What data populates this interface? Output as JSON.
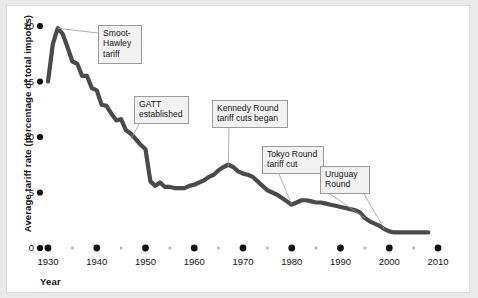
{
  "figure": {
    "background_color": "#e9e9e9",
    "plate_color": "#ffffff",
    "line_color": "#4a4a4a",
    "tick_color": "#111111",
    "minor_tick_color": "#b8b8b8",
    "callout_bg": "#f2f2f2",
    "callout_border": "#9b9b9b",
    "leader_color": "#9b9b9b",
    "source_note": "·· ··"
  },
  "chart_data": {
    "type": "line",
    "title": "",
    "xlabel": "Year",
    "ylabel": "Average tariff rate (percentage of total imports)",
    "xlim": [
      1930,
      2010
    ],
    "ylim": [
      0,
      20
    ],
    "grid": false,
    "legend": "none",
    "y_ticks": [
      {
        "value": 0,
        "label": "0"
      },
      {
        "value": 5,
        "label": "5"
      },
      {
        "value": 10,
        "label": "10"
      },
      {
        "value": 15,
        "label": "15"
      },
      {
        "value": 20,
        "label": "20"
      }
    ],
    "x_ticks": [
      {
        "value": 1930,
        "label": "1930",
        "major": true
      },
      {
        "value": 1935,
        "label": "",
        "major": false
      },
      {
        "value": 1940,
        "label": "1940",
        "major": true
      },
      {
        "value": 1945,
        "label": "",
        "major": false
      },
      {
        "value": 1950,
        "label": "1950",
        "major": true
      },
      {
        "value": 1955,
        "label": "",
        "major": false
      },
      {
        "value": 1960,
        "label": "1960",
        "major": true
      },
      {
        "value": 1965,
        "label": "",
        "major": false
      },
      {
        "value": 1970,
        "label": "1970",
        "major": true
      },
      {
        "value": 1975,
        "label": "",
        "major": false
      },
      {
        "value": 1980,
        "label": "1980",
        "major": true
      },
      {
        "value": 1985,
        "label": "",
        "major": false
      },
      {
        "value": 1990,
        "label": "1990",
        "major": true
      },
      {
        "value": 1995,
        "label": "",
        "major": false
      },
      {
        "value": 2000,
        "label": "2000",
        "major": true
      },
      {
        "value": 2005,
        "label": "",
        "major": false
      },
      {
        "value": 2010,
        "label": "2010",
        "major": true
      }
    ],
    "series": [
      {
        "name": "Average tariff rate",
        "x": [
          1930,
          1931,
          1932,
          1933,
          1934,
          1935,
          1936,
          1937,
          1938,
          1939,
          1940,
          1941,
          1942,
          1943,
          1944,
          1945,
          1946,
          1947,
          1948,
          1949,
          1950,
          1951,
          1952,
          1953,
          1954,
          1955,
          1956,
          1957,
          1958,
          1959,
          1960,
          1961,
          1962,
          1963,
          1964,
          1965,
          1966,
          1967,
          1968,
          1969,
          1970,
          1971,
          1972,
          1973,
          1974,
          1975,
          1976,
          1977,
          1978,
          1979,
          1980,
          1981,
          1982,
          1983,
          1984,
          1985,
          1986,
          1987,
          1988,
          1989,
          1990,
          1991,
          1992,
          1993,
          1994,
          1995,
          1996,
          1997,
          1998,
          1999,
          2000,
          2001,
          2002,
          2003,
          2004,
          2005,
          2006,
          2007,
          2008
        ],
        "values": [
          15.0,
          18.4,
          19.8,
          19.3,
          18.1,
          16.8,
          16.6,
          15.5,
          15.5,
          14.4,
          14.2,
          12.9,
          12.8,
          12.1,
          11.5,
          11.6,
          10.6,
          10.3,
          9.8,
          9.3,
          8.9,
          6.0,
          5.6,
          5.9,
          5.5,
          5.5,
          5.4,
          5.4,
          5.4,
          5.6,
          5.7,
          5.9,
          6.1,
          6.4,
          6.6,
          7.0,
          7.3,
          7.5,
          7.3,
          6.9,
          6.7,
          6.6,
          6.4,
          6.0,
          5.6,
          5.2,
          5.0,
          4.8,
          4.5,
          4.2,
          3.9,
          4.1,
          4.3,
          4.3,
          4.2,
          4.1,
          4.1,
          4.0,
          3.9,
          3.8,
          3.7,
          3.6,
          3.5,
          3.4,
          3.2,
          2.7,
          2.4,
          2.2,
          2.0,
          1.7,
          1.5,
          1.4,
          1.4,
          1.4,
          1.4,
          1.4,
          1.4,
          1.4,
          1.4
        ]
      }
    ],
    "annotations": [
      {
        "id": "smoot-hawley",
        "label": "Smoot-\nHawley\ntariff",
        "target_x": 1932,
        "target_y": 19.8
      },
      {
        "id": "gatt-established",
        "label": "GATT\nestablished",
        "target_x": 1947,
        "target_y": 9.8
      },
      {
        "id": "kennedy-round",
        "label": "Kennedy Round\ntariff cuts began",
        "target_x": 1967,
        "target_y": 7.4
      },
      {
        "id": "tokyo-round",
        "label": "Tokyo Round\ntariff cut",
        "target_x": 1980,
        "target_y": 3.9
      },
      {
        "id": "uruguay-round",
        "label": "Uruguay\nRound",
        "target_x": 1995,
        "target_y": 2.7
      }
    ]
  }
}
